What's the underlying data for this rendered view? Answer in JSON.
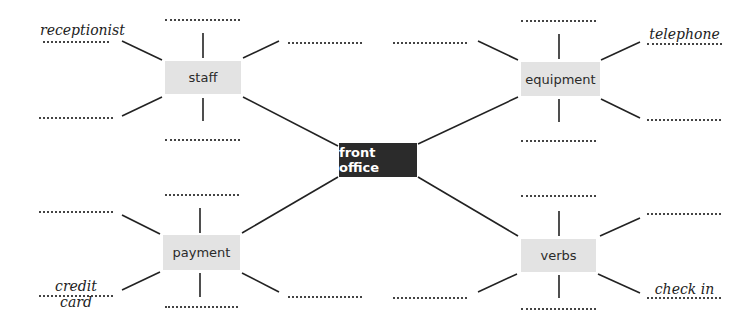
{
  "center": {
    "label": "front office"
  },
  "nodes": [
    {
      "id": "staff",
      "label": "staff"
    },
    {
      "id": "equipment",
      "label": "equipment"
    },
    {
      "id": "payment",
      "label": "payment"
    },
    {
      "id": "verbs",
      "label": "verbs"
    }
  ],
  "examples": {
    "staff": "receptionist",
    "equipment": "telephone",
    "payment": "credit card",
    "verbs": "check in"
  },
  "colors": {
    "center_fill": "#2b2b2b",
    "node_fill": "#e3e3e3",
    "line": "#222222"
  }
}
